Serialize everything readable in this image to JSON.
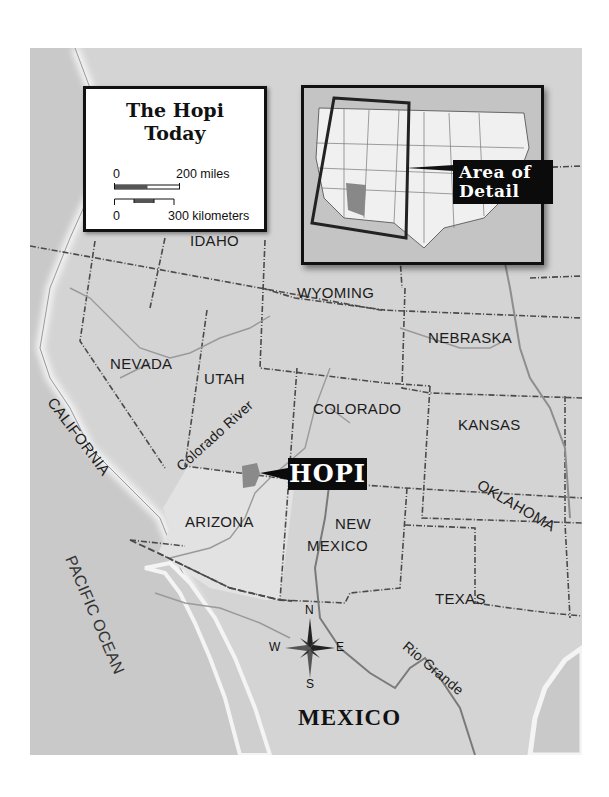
{
  "legend": {
    "title_line1": "The Hopi",
    "title_line2": "Today",
    "scale_miles_start": "0",
    "scale_miles_end": "200 miles",
    "scale_km_start": "0",
    "scale_km_end": "300 kilometers"
  },
  "inset": {
    "callout_line1": "Area of",
    "callout_line2": "Detail",
    "highlighted_state": "Arizona"
  },
  "hopi_callout": "HOPI",
  "states": [
    {
      "name": "IDAHO"
    },
    {
      "name": "WYOMING"
    },
    {
      "name": "NEBRASKA"
    },
    {
      "name": "NEVADA"
    },
    {
      "name": "UTAH"
    },
    {
      "name": "COLORADO"
    },
    {
      "name": "KANSAS"
    },
    {
      "name": "CALIFORNIA"
    },
    {
      "name": "ARIZONA"
    },
    {
      "name": "NEW"
    },
    {
      "name": "MEXICO"
    },
    {
      "name": "OKLAHOMA"
    },
    {
      "name": "TEXAS"
    }
  ],
  "rivers": {
    "colorado": "Colorado River",
    "rio_grande": "Rio Grande"
  },
  "water": {
    "pacific": "PACIFIC OCEAN"
  },
  "country": {
    "mexico": "MEXICO"
  },
  "compass": {
    "n": "N",
    "s": "S",
    "e": "E",
    "w": "W"
  },
  "colors": {
    "land": "#d4d4d4",
    "arizona": "#e2e2e2",
    "ocean": "#c8c8c8",
    "coast_glow": "#f4f4f4",
    "border": "#4a4a4a",
    "river": "#8e8e8e",
    "hopi_area": "#8a8a8a",
    "callout_bg": "#0b0b0b"
  }
}
